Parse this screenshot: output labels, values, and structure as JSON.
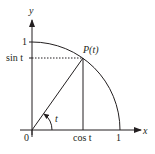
{
  "diagram": {
    "axes": {
      "x_label": "x",
      "y_label": "y"
    },
    "labels": {
      "origin": "0",
      "x_one": "1",
      "y_one": "1",
      "point": "P(t)",
      "sin": "sin t",
      "cos": "cos t",
      "angle": "t"
    },
    "colors": {
      "stroke": "#231f20",
      "background": "#ffffff"
    }
  }
}
